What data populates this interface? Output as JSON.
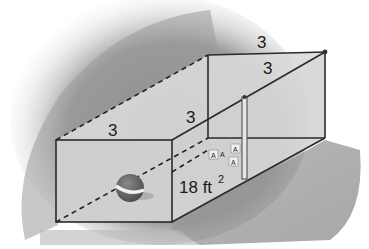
{
  "figure": {
    "type": "rectangular-prism-net-cage",
    "labels": {
      "front_top_edge": "3",
      "back_top_edge": "3",
      "right_top_depth_edge": "3",
      "left_top_depth_edge": "3",
      "area": "18 ft",
      "area_exponent": "2"
    },
    "objects": {
      "ball": "beach-ball",
      "blocks": [
        "A",
        "A",
        "A",
        "A"
      ]
    },
    "colors": {
      "background_shadow": "#8c8c8c",
      "face_fill": "#d4d4d4",
      "edge": "#2a2a2a",
      "ball_top": "#6e6e6e",
      "ball_stripe": "#f2f2f2"
    }
  }
}
